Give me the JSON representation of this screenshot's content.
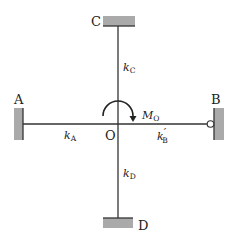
{
  "diagram": {
    "type": "rigid-joint frame with moment load",
    "joint": {
      "label": "O"
    },
    "supports": [
      {
        "id": "A",
        "label": "A",
        "type": "fixed",
        "side": "left"
      },
      {
        "id": "B",
        "label": "B",
        "type": "pinned",
        "side": "right"
      },
      {
        "id": "C",
        "label": "C",
        "type": "fixed",
        "side": "top"
      },
      {
        "id": "D",
        "label": "D",
        "type": "fixed",
        "side": "bottom"
      }
    ],
    "members": [
      {
        "from": "A",
        "to": "O",
        "stiffness": {
          "k": "k",
          "sub": "A",
          "prime": ""
        }
      },
      {
        "from": "O",
        "to": "B",
        "stiffness": {
          "k": "k",
          "sub": "B",
          "prime": "′"
        }
      },
      {
        "from": "C",
        "to": "O",
        "stiffness": {
          "k": "k",
          "sub": "C",
          "prime": ""
        }
      },
      {
        "from": "O",
        "to": "D",
        "stiffness": {
          "k": "k",
          "sub": "D",
          "prime": ""
        }
      }
    ],
    "moment": {
      "symbol": "M",
      "sub": "O",
      "direction": "clockwise"
    },
    "colors": {
      "line": "#333333",
      "support": "#aaaaaa"
    }
  }
}
